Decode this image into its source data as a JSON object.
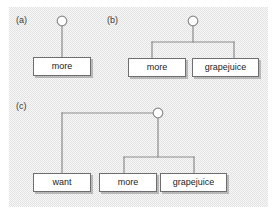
{
  "figure": {
    "background_color": "#e2e2e2",
    "box_fill": "#ffffff",
    "line_color": "#8c8c8c",
    "box_border_color": "#6e6e6e",
    "text_color": "#1c1c1c"
  },
  "panels": [
    {
      "label": "(a)",
      "root": {
        "shape": "circle",
        "filled": false
      },
      "leaves": [
        {
          "text": "more"
        }
      ]
    },
    {
      "label": "(b)",
      "root": {
        "shape": "circle",
        "filled": false
      },
      "leaves": [
        {
          "text": "more"
        },
        {
          "text": "grapejuice"
        }
      ]
    },
    {
      "label": "(c)",
      "root": {
        "shape": "circle",
        "filled": false
      },
      "leaves": [
        {
          "text": "want"
        },
        {
          "text": "more"
        },
        {
          "text": "grapejuice"
        }
      ]
    }
  ]
}
